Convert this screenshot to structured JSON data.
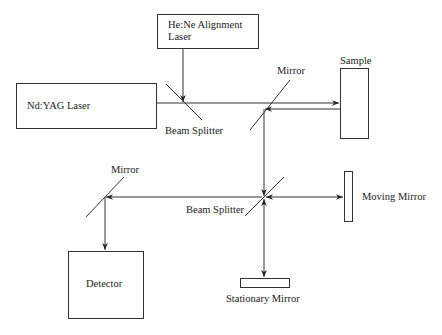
{
  "diagram": {
    "type": "optical-setup",
    "components": {
      "hene_laser": {
        "label_line1": "He:Ne Alignment",
        "label_line2": "Laser"
      },
      "ndyag_laser": {
        "label": "Nd:YAG Laser"
      },
      "beam_splitter_top": {
        "label": "Beam Splitter"
      },
      "mirror_top": {
        "label": "Mirror"
      },
      "sample": {
        "label": "Sample"
      },
      "beam_splitter_center": {
        "label": "Beam Splitter"
      },
      "moving_mirror": {
        "label": "Moving Mirror"
      },
      "stationary_mirror": {
        "label": "Stationary Mirror"
      },
      "mirror_left": {
        "label": "Mirror"
      },
      "detector": {
        "label": "Detector"
      }
    },
    "colors": {
      "line": "#333333",
      "text": "#222222",
      "background": "#ffffff"
    }
  }
}
